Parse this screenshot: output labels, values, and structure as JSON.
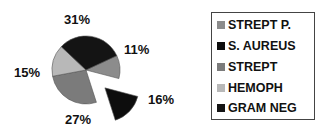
{
  "chart_data": {
    "type": "pie",
    "title": "",
    "categories": [
      "STREPT P.",
      "S. AUREUS",
      "STREPT",
      "HEMOPH",
      "GRAM NEG"
    ],
    "values": [
      11,
      16,
      27,
      15,
      31
    ],
    "labels": [
      "11%",
      "16%",
      "27%",
      "15%",
      "31%"
    ],
    "colors": [
      "#8c8c8c",
      "#0d0d0d",
      "#7b7b7b",
      "#b8b8b8",
      "#141414"
    ],
    "exploded": [
      "S. AUREUS"
    ],
    "legend_position": "right"
  },
  "legend": {
    "items": [
      {
        "label": "STREPT P.",
        "color": "#8c8c8c"
      },
      {
        "label": "S. AUREUS",
        "color": "#0d0d0d"
      },
      {
        "label": "STREPT",
        "color": "#7b7b7b"
      },
      {
        "label": "HEMOPH",
        "color": "#b8b8b8"
      },
      {
        "label": "GRAM NEG",
        "color": "#141414"
      }
    ]
  },
  "slice_labels": {
    "strept_p": "11%",
    "s_aureus": "16%",
    "strept": "27%",
    "hemoph": "15%",
    "gram_neg": "31%"
  }
}
